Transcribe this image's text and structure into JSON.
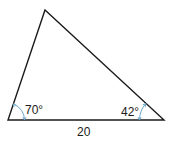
{
  "diagram": {
    "type": "triangle",
    "vertices": {
      "top": [
        45,
        10
      ],
      "bottom_left": [
        8,
        120
      ],
      "bottom_right": [
        164,
        120
      ]
    },
    "labels": {
      "angle_left": "70°",
      "angle_right": "42°",
      "base_side": "20"
    },
    "colors": {
      "stroke": "#1a1a1a",
      "angle_arc": "#6aa6c8"
    }
  }
}
